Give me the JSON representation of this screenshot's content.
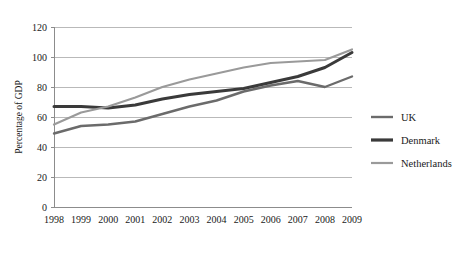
{
  "chart_data": {
    "type": "line",
    "title": "",
    "xlabel": "",
    "ylabel": "Percentage of GDP",
    "x": [
      "1998",
      "1999",
      "2000",
      "2001",
      "2002",
      "2003",
      "2004",
      "2005",
      "2006",
      "2007",
      "2008",
      "2009"
    ],
    "categories": [
      "1998",
      "1999",
      "2000",
      "2001",
      "2002",
      "2003",
      "2004",
      "2005",
      "2006",
      "2007",
      "2008",
      "2009"
    ],
    "ylim": [
      0,
      120
    ],
    "yticks": [
      0,
      20,
      40,
      60,
      80,
      100,
      120
    ],
    "ytick_labels": [
      "0",
      "20",
      "40",
      "60",
      "80",
      "100",
      "120"
    ],
    "grid": true,
    "legend_position": "right",
    "series": [
      {
        "name": "UK",
        "color": "#6b6b6b",
        "values": [
          49,
          54,
          55,
          57,
          62,
          67,
          71,
          77,
          81,
          84,
          80,
          87
        ]
      },
      {
        "name": "Denmark",
        "color": "#3a3a3a",
        "values": [
          67,
          67,
          66,
          68,
          72,
          75,
          77,
          79,
          83,
          87,
          93,
          103
        ]
      },
      {
        "name": "Netherlands",
        "color": "#9a9a9a",
        "values": [
          55,
          63,
          67,
          73,
          80,
          85,
          89,
          93,
          96,
          97,
          98,
          105
        ]
      }
    ]
  },
  "legend": {
    "items": [
      {
        "label": "UK",
        "color": "#6b6b6b",
        "width": 2.4
      },
      {
        "label": "Denmark",
        "color": "#3a3a3a",
        "width": 3.2
      },
      {
        "label": "Netherlands",
        "color": "#9a9a9a",
        "width": 2.2
      }
    ]
  },
  "axes": {
    "y_title": "Percentage of GDP"
  }
}
